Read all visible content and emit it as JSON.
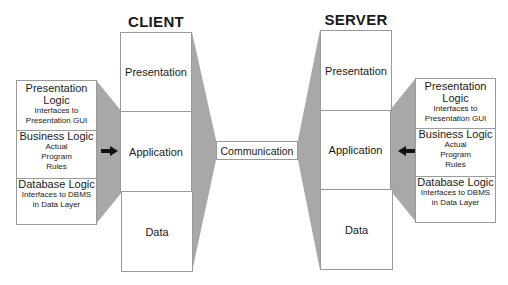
{
  "client": {
    "title": "CLIENT",
    "layers": [
      "Presentation",
      "Application",
      "Data"
    ],
    "logic_box": [
      {
        "head": "Presentation Logic",
        "sub": "Interfaces to Presentation GUI"
      },
      {
        "head": "Business Logic",
        "sub": "Actual Program Rules"
      },
      {
        "head": "Database Logic",
        "sub": "Interfaces to DBMS in Data Layer"
      }
    ]
  },
  "server": {
    "title": "SERVER",
    "layers": [
      "Presentation",
      "Application",
      "Data"
    ],
    "logic_box": [
      {
        "head": "Presentation Logic",
        "sub": "Interfaces to Presentation GUI"
      },
      {
        "head": "Business Logic",
        "sub": "Actual Program Rules"
      },
      {
        "head": "Database Logic",
        "sub": "Interfaces to DBMS in Data Layer"
      }
    ]
  },
  "communication": {
    "label": "Communication"
  },
  "colors": {
    "shade": "#a8a8a8",
    "border": "#9a9a9a",
    "arrow": "#111111"
  }
}
